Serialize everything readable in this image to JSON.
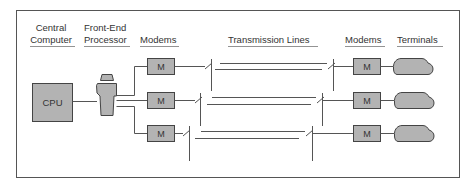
{
  "colors": {
    "frame": "#555555",
    "line": "#555555",
    "box_fill": "#b3b3b3",
    "box_stroke": "#444444",
    "text": "#333333",
    "background": "#ffffff"
  },
  "headers": {
    "central_computer": {
      "line1": "Central",
      "line2": "Computer"
    },
    "front_end_processor": {
      "line1": "Front-End",
      "line2": "Processor"
    },
    "modems_left": "Modems",
    "transmission_lines": "Transmission Lines",
    "modems_right": "Modems",
    "terminals": "Terminals"
  },
  "cpu": {
    "label": "CPU"
  },
  "modem_label": "M",
  "channels": [
    {
      "id": "top",
      "left_modem": "M",
      "right_modem": "M",
      "terminal_icon": "terminal-icon"
    },
    {
      "id": "middle",
      "left_modem": "M",
      "right_modem": "M",
      "terminal_icon": "terminal-icon"
    },
    {
      "id": "bottom",
      "left_modem": "M",
      "right_modem": "M",
      "terminal_icon": "terminal-icon"
    }
  ]
}
